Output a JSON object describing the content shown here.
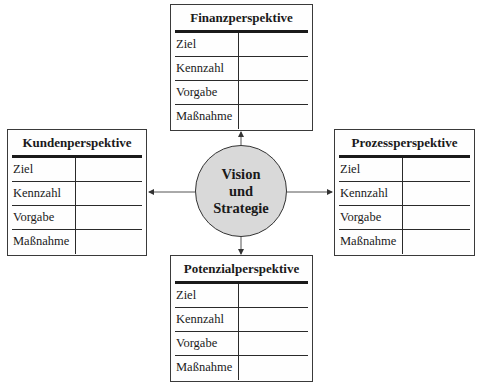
{
  "center": {
    "lines": [
      "Vision",
      "und",
      "Strategie"
    ]
  },
  "perspectives": {
    "top": {
      "title": "Finanzperspektive",
      "rows": [
        {
          "label": "Ziel",
          "value": ""
        },
        {
          "label": "Kennzahl",
          "value": ""
        },
        {
          "label": "Vorgabe",
          "value": ""
        },
        {
          "label": "Maßnahme",
          "value": ""
        }
      ]
    },
    "left": {
      "title": "Kundenperspektive",
      "rows": [
        {
          "label": "Ziel",
          "value": ""
        },
        {
          "label": "Kennzahl",
          "value": ""
        },
        {
          "label": "Vorgabe",
          "value": ""
        },
        {
          "label": "Maßnahme",
          "value": ""
        }
      ]
    },
    "right": {
      "title": "Prozessperspektive",
      "rows": [
        {
          "label": "Ziel",
          "value": ""
        },
        {
          "label": "Kennzahl",
          "value": ""
        },
        {
          "label": "Vorgabe",
          "value": ""
        },
        {
          "label": "Maßnahme",
          "value": ""
        }
      ]
    },
    "bottom": {
      "title": "Potenzialperspektive",
      "rows": [
        {
          "label": "Ziel",
          "value": ""
        },
        {
          "label": "Kennzahl",
          "value": ""
        },
        {
          "label": "Vorgabe",
          "value": ""
        },
        {
          "label": "Maßnahme",
          "value": ""
        }
      ]
    }
  },
  "colors": {
    "circle_fill": "#d9d9d9",
    "line": "#333333"
  }
}
